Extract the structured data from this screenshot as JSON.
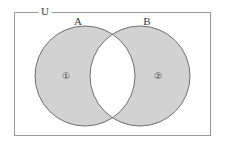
{
  "figure": {
    "type": "venn-diagram",
    "width": 225,
    "height": 148,
    "background_color": "#ffffff"
  },
  "universe": {
    "label": "U",
    "label_x": 45,
    "label_y": 12,
    "rect": {
      "x": 14,
      "y": 12,
      "width": 197,
      "height": 124
    },
    "border_color": "#9a9a9a",
    "border_width": 1,
    "fill_color": "#ffffff"
  },
  "sets": [
    {
      "name": "set-a",
      "label": "A",
      "label_x": 78,
      "label_y": 22,
      "cx": 85,
      "cy": 76,
      "r": 50,
      "fill_color": "#d2d2d2",
      "stroke_color": "#6e6e6e"
    },
    {
      "name": "set-b",
      "label": "B",
      "label_x": 147,
      "label_y": 22,
      "cx": 140,
      "cy": 76,
      "r": 50,
      "fill_color": "#d2d2d2",
      "stroke_color": "#6e6e6e"
    }
  ],
  "regions": [
    {
      "name": "region-one",
      "label": "①",
      "x": 66,
      "y": 76,
      "description": "A only",
      "shaded": true
    },
    {
      "name": "region-two",
      "label": "②",
      "x": 158,
      "y": 76,
      "description": "B only",
      "shaded": true
    }
  ],
  "intersection": {
    "name": "intersection",
    "fill_color": "#ffffff",
    "shaded": false
  },
  "colors": {
    "shade": "#d2d2d2",
    "circle_stroke": "#6e6e6e",
    "rect_stroke": "#9a9a9a",
    "text": "#3a3a3a",
    "white": "#ffffff"
  }
}
